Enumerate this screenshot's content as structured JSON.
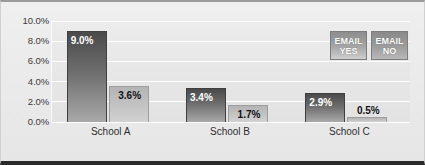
{
  "chart_data": {
    "type": "bar",
    "title": "",
    "subtitle": "",
    "xlabel": "",
    "ylabel": "",
    "categories": [
      "School A",
      "School B",
      "School C"
    ],
    "series": [
      {
        "name": "EMAIL YES",
        "values": [
          9.0,
          3.4,
          2.9
        ],
        "labels": [
          "9.0%",
          "3.4%",
          "2.9%"
        ],
        "color": "#5a5a5a"
      },
      {
        "name": "EMAIL NO",
        "values": [
          3.6,
          1.7,
          0.5
        ],
        "labels": [
          "3.6%",
          "1.7%",
          "0.5%"
        ],
        "color": "#c2c2c2"
      }
    ],
    "ylim": [
      0,
      10
    ],
    "ytick_values": [
      0.0,
      2.0,
      4.0,
      6.0,
      8.0,
      10.0
    ],
    "ytick_labels": [
      "0.0%",
      "2.0%",
      "4.0%",
      "6.0%",
      "8.0%",
      "10.0%"
    ],
    "grid": true,
    "grid_color": "#ffffff",
    "legend_position": "top-right",
    "background_color": "#e9e9e9",
    "plot_background_color": "#e4e4e4"
  },
  "legend": {
    "items": [
      {
        "line1": "EMAIL",
        "line2": "YES"
      },
      {
        "line1": "EMAIL",
        "line2": "NO"
      }
    ]
  }
}
